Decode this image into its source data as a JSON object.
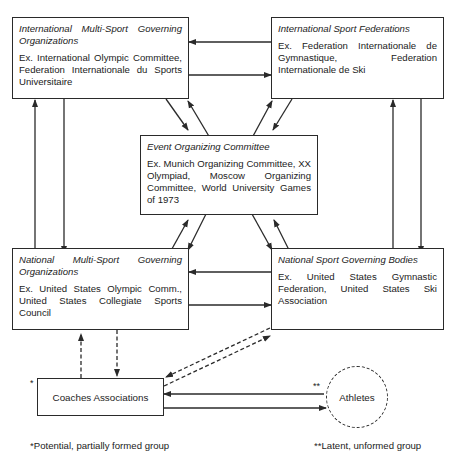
{
  "nodes": {
    "intl_multi": {
      "title": "International Multi-Sport Governing Organizations",
      "example": "Ex. International Olympic Committee, Federation Internationale du Sports Universitaire"
    },
    "intl_sport": {
      "title": "International Sport Federations",
      "example": "Ex. Federation Internationale de Gymnastique, Federation Internationale de Ski"
    },
    "event": {
      "title": "Event Organizing Committee",
      "example": "Ex. Munich Organizing Committee, XX Olympiad, Moscow Organizing Committee, World University Games of 1973"
    },
    "natl_multi": {
      "title": "National Multi-Sport Governing Organizations",
      "example": "Ex. United States Olympic Comm., United States Collegiate Sports Council"
    },
    "natl_sport": {
      "title": "National Sport Governing Bodies",
      "example": "Ex. United States Gymnastic Federation, United States Ski Association"
    },
    "coaches": {
      "label": "Coaches Associations",
      "marker": "*"
    },
    "athletes": {
      "label": "Athletes",
      "marker": "**"
    }
  },
  "footnotes": {
    "potential": "*Potential, partially formed group",
    "latent": "**Latent, unformed group"
  },
  "edges": [
    {
      "from": "intl_sport",
      "to": "intl_multi",
      "style": "solid"
    },
    {
      "from": "intl_multi",
      "to": "intl_sport",
      "style": "solid"
    },
    {
      "from": "natl_multi",
      "to": "intl_multi",
      "style": "solid"
    },
    {
      "from": "intl_multi",
      "to": "natl_multi",
      "style": "solid"
    },
    {
      "from": "natl_sport",
      "to": "intl_sport",
      "style": "solid"
    },
    {
      "from": "intl_sport",
      "to": "natl_sport",
      "style": "solid"
    },
    {
      "from": "intl_multi",
      "to": "event",
      "style": "solid"
    },
    {
      "from": "event",
      "to": "intl_multi",
      "style": "solid"
    },
    {
      "from": "event",
      "to": "intl_sport",
      "style": "solid"
    },
    {
      "from": "intl_sport",
      "to": "event",
      "style": "solid"
    },
    {
      "from": "natl_multi",
      "to": "event",
      "style": "solid"
    },
    {
      "from": "event",
      "to": "natl_multi",
      "style": "solid"
    },
    {
      "from": "event",
      "to": "natl_sport",
      "style": "solid"
    },
    {
      "from": "natl_sport",
      "to": "event",
      "style": "solid"
    },
    {
      "from": "natl_sport",
      "to": "natl_multi",
      "style": "solid"
    },
    {
      "from": "natl_multi",
      "to": "natl_sport",
      "style": "solid"
    },
    {
      "from": "coaches",
      "to": "natl_multi",
      "style": "dashed"
    },
    {
      "from": "natl_multi",
      "to": "coaches",
      "style": "dashed"
    },
    {
      "from": "natl_sport",
      "to": "coaches",
      "style": "dashed"
    },
    {
      "from": "coaches",
      "to": "natl_sport",
      "style": "dashed"
    },
    {
      "from": "athletes",
      "to": "coaches",
      "style": "solid"
    },
    {
      "from": "coaches",
      "to": "athletes",
      "style": "solid"
    }
  ]
}
